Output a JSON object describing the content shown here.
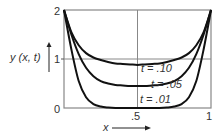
{
  "chart_data": {
    "type": "line",
    "title": "",
    "xlabel": "x",
    "ylabel": "y (x, t)",
    "xlim": [
      0,
      1
    ],
    "ylim": [
      0,
      2
    ],
    "x_ticks": [
      "0",
      ".5",
      "1"
    ],
    "y_ticks": [
      "0",
      "1",
      "2"
    ],
    "grid": false,
    "reference_lines": [
      {
        "orientation": "vertical",
        "x": 0.5
      },
      {
        "orientation": "horizontal",
        "y": 1
      }
    ],
    "x": [
      0,
      0.05,
      0.1,
      0.15,
      0.2,
      0.25,
      0.3,
      0.35,
      0.4,
      0.45,
      0.5,
      0.55,
      0.6,
      0.65,
      0.7,
      0.75,
      0.8,
      0.85,
      0.9,
      0.95,
      1
    ],
    "series": [
      {
        "name": "t = .10",
        "values": [
          2,
          1.55,
          1.28,
          1.12,
          1.03,
          0.98,
          0.94,
          0.91,
          0.9,
          0.89,
          0.88,
          0.89,
          0.9,
          0.91,
          0.94,
          0.98,
          1.03,
          1.12,
          1.28,
          1.55,
          2
        ]
      },
      {
        "name": "t = .05",
        "values": [
          2,
          1.5,
          1.1,
          0.82,
          0.65,
          0.55,
          0.5,
          0.47,
          0.46,
          0.45,
          0.45,
          0.45,
          0.46,
          0.47,
          0.5,
          0.55,
          0.65,
          0.82,
          1.1,
          1.5,
          2
        ]
      },
      {
        "name": "t = .01",
        "values": [
          2,
          1.2,
          0.55,
          0.22,
          0.08,
          0.03,
          0.01,
          0,
          0,
          0,
          0,
          0,
          0,
          0,
          0.01,
          0.03,
          0.08,
          0.22,
          0.55,
          1.2,
          2
        ]
      }
    ],
    "annotations": [
      "t = .10",
      "t = .05",
      "t = .01"
    ],
    "legend": "none (inline labels)"
  },
  "labels": {
    "ylabel": "y (x, t)",
    "xlabel": "x",
    "y0": "0",
    "y1": "1",
    "y2": "2",
    "x05": ".5",
    "x1": "1",
    "t10": "t = .10",
    "t05": "t = .05",
    "t01": "t = .01"
  }
}
